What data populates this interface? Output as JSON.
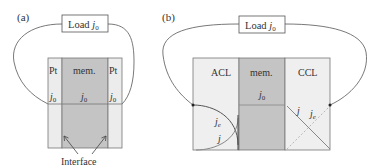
{
  "panel_a": {
    "label": "(a)",
    "load_label": "Load ",
    "load_sym": "j",
    "load_sub": "0",
    "regions": [
      {
        "name": "Pt",
        "j": "j",
        "sub": "0"
      },
      {
        "name": "mem.",
        "j": "j",
        "sub": "0"
      },
      {
        "name": "Pt",
        "j": "j",
        "sub": "0"
      }
    ],
    "interface_label": "Interface"
  },
  "panel_b": {
    "label": "(b)",
    "load_label": "Load ",
    "load_sym": "j",
    "load_sub": "0",
    "regions": [
      {
        "name": "ACL"
      },
      {
        "name": "mem.",
        "j": "j",
        "sub": "0"
      },
      {
        "name": "CCL"
      }
    ],
    "curve_labels": {
      "je": "j",
      "je_sub": "e",
      "j": "j"
    },
    "ccl_labels": {
      "j": "j",
      "je": "j",
      "je_sub": "e"
    }
  },
  "colors": {
    "pt_fill": "#ececec",
    "mem_fill": "#c4c4c4",
    "cl_fill": "#efefef",
    "stroke": "#666666"
  }
}
